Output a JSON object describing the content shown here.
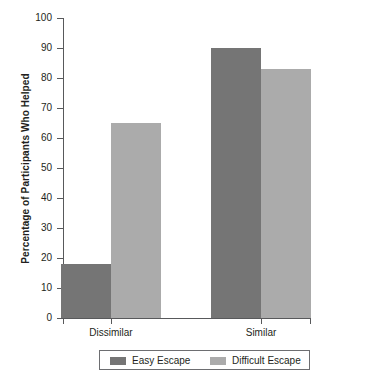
{
  "chart_data": {
    "type": "bar",
    "title": "",
    "xlabel": "",
    "ylabel": "Percentage of Participants Who Helped",
    "categories": [
      "Dissimilar",
      "Similar"
    ],
    "series": [
      {
        "name": "Easy Escape",
        "values": [
          18,
          90
        ],
        "color": "#757575"
      },
      {
        "name": "Difficult Escape",
        "values": [
          65,
          83
        ],
        "color": "#ababab"
      }
    ],
    "ylim": [
      0,
      100
    ],
    "ytick_step": 10,
    "ytick_labels": [
      "100",
      "90",
      "80",
      "70",
      "60",
      "50",
      "40",
      "30",
      "20",
      "10",
      "0"
    ],
    "grid": false,
    "legend_position": "bottom"
  },
  "axis": {
    "y_title": "Percentage of Participants Who Helped",
    "line_color": "#58595b"
  },
  "legend": {
    "entries": [
      {
        "label": "Easy Escape",
        "color": "#757575"
      },
      {
        "label": "Difficult Escape",
        "color": "#ababab"
      }
    ]
  }
}
